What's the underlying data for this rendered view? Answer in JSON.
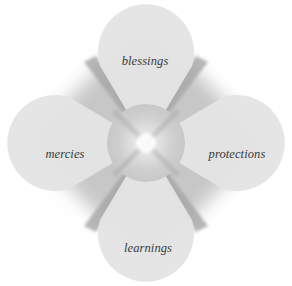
{
  "diagram": {
    "type": "four-petal-cycle",
    "center": {
      "label": ""
    },
    "petals": [
      {
        "id": "top",
        "label": "blessings"
      },
      {
        "id": "right",
        "label": "protections"
      },
      {
        "id": "bottom",
        "label": "learnings"
      },
      {
        "id": "left",
        "label": "mercies"
      }
    ],
    "colors": {
      "petal_fill": "#e4e4e4",
      "center_fill": "#cdcdcd",
      "center_highlight": "#ffffff",
      "glow": "#9a9a9a",
      "label_text": "#3a3a3a",
      "background": "#ffffff"
    }
  }
}
